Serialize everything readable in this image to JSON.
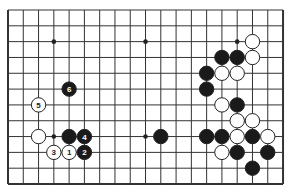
{
  "board": {
    "columns": 19,
    "rows": 12,
    "origin_x": 8,
    "origin_y": 10,
    "spacing_x": 15.28,
    "spacing_y": 15.82,
    "edges": {
      "top": false,
      "bottom": true,
      "left": true,
      "right": true
    },
    "line_color": "#333333",
    "background": "#ffffff",
    "stone_radius": 7.2
  },
  "star_points": [
    {
      "col": 3,
      "row": 2
    },
    {
      "col": 9,
      "row": 2
    },
    {
      "col": 15,
      "row": 2
    },
    {
      "col": 3,
      "row": 8
    },
    {
      "col": 9,
      "row": 8
    },
    {
      "col": 15,
      "row": 8
    }
  ],
  "stones": [
    {
      "color": "white",
      "col": 16,
      "row": 2,
      "label": ""
    },
    {
      "color": "black",
      "col": 14,
      "row": 3,
      "label": ""
    },
    {
      "color": "black",
      "col": 15,
      "row": 3,
      "label": ""
    },
    {
      "color": "white",
      "col": 16,
      "row": 3,
      "label": ""
    },
    {
      "color": "black",
      "col": 13,
      "row": 4,
      "label": ""
    },
    {
      "color": "white",
      "col": 14,
      "row": 4,
      "label": ""
    },
    {
      "color": "white",
      "col": 15,
      "row": 4,
      "label": ""
    },
    {
      "color": "black",
      "col": 4,
      "row": 5,
      "label": "6"
    },
    {
      "color": "black",
      "col": 13,
      "row": 5,
      "label": ""
    },
    {
      "color": "white",
      "col": 2,
      "row": 6,
      "label": "5"
    },
    {
      "color": "white",
      "col": 14,
      "row": 6,
      "label": ""
    },
    {
      "color": "black",
      "col": 15,
      "row": 6,
      "label": ""
    },
    {
      "color": "white",
      "col": 15,
      "row": 7,
      "label": ""
    },
    {
      "color": "white",
      "col": 16,
      "row": 7,
      "label": ""
    },
    {
      "color": "white",
      "col": 2,
      "row": 8,
      "label": ""
    },
    {
      "color": "black",
      "col": 4,
      "row": 8,
      "label": ""
    },
    {
      "color": "black",
      "col": 5,
      "row": 8,
      "label": "4"
    },
    {
      "color": "black",
      "col": 10,
      "row": 8,
      "label": ""
    },
    {
      "color": "black",
      "col": 13,
      "row": 8,
      "label": ""
    },
    {
      "color": "black",
      "col": 14,
      "row": 8,
      "label": ""
    },
    {
      "color": "white",
      "col": 15,
      "row": 8,
      "label": ""
    },
    {
      "color": "black",
      "col": 16,
      "row": 8,
      "label": ""
    },
    {
      "color": "white",
      "col": 17,
      "row": 8,
      "label": ""
    },
    {
      "color": "white",
      "col": 3,
      "row": 9,
      "label": "3"
    },
    {
      "color": "white",
      "col": 4,
      "row": 9,
      "label": "1"
    },
    {
      "color": "black",
      "col": 5,
      "row": 9,
      "label": "2"
    },
    {
      "color": "white",
      "col": 14,
      "row": 9,
      "label": ""
    },
    {
      "color": "black",
      "col": 15,
      "row": 9,
      "label": ""
    },
    {
      "color": "black",
      "col": 17,
      "row": 9,
      "label": ""
    },
    {
      "color": "black",
      "col": 16,
      "row": 10,
      "label": ""
    }
  ],
  "colors": {
    "black_stone": "#1a1a1a",
    "white_stone": "#ffffff",
    "stone_outline": "#222222",
    "black_label": "#ffffff",
    "white_label": "#222222",
    "star_point": "#222222"
  }
}
